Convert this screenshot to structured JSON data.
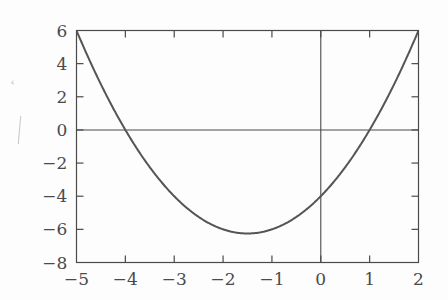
{
  "figure": {
    "background_color": "#fdfdfd",
    "axis_color": "#4a4a4a",
    "curve_color": "#555555",
    "tick_label_color": "#4a4a4a",
    "ylabel_fragment_color": "#c2c2c2",
    "ylabel_fragment_glyph": "ˆ"
  },
  "chart_data": {
    "type": "line",
    "title": "",
    "subtitle": "",
    "xlabel": "",
    "ylabel": "",
    "legend": [],
    "legend_position": "none",
    "grid": false,
    "frame": true,
    "tick_direction": "in",
    "xlim": [
      -5,
      2
    ],
    "ylim": [
      -8,
      6
    ],
    "xticks": [
      -5,
      -4,
      -3,
      -2,
      -1,
      0,
      1,
      2
    ],
    "xtick_labels": [
      "−5",
      "−4",
      "−3",
      "−2",
      "−1",
      "0",
      "1",
      "2"
    ],
    "yticks": [
      -8,
      -6,
      -4,
      -2,
      0,
      2,
      4,
      6
    ],
    "ytick_labels": [
      "−8",
      "−6",
      "−4",
      "−2",
      "0",
      "2",
      "4",
      "6"
    ],
    "reference_lines": [
      {
        "name": "x-axis",
        "orientation": "horizontal",
        "value": 0
      },
      {
        "name": "y-axis",
        "orientation": "vertical",
        "value": 0
      }
    ],
    "series": [
      {
        "name": "parabola",
        "expression": "y = x^2 + 3x - 4",
        "roots": [
          -4,
          1
        ],
        "vertex": [
          -1.5,
          -6.25
        ],
        "y_intercept": -4,
        "x": [
          -5,
          -4.75,
          -4.5,
          -4.25,
          -4,
          -3.75,
          -3.5,
          -3.25,
          -3,
          -2.75,
          -2.5,
          -2.25,
          -2,
          -1.75,
          -1.5,
          -1.25,
          -1,
          -0.75,
          -0.5,
          -0.25,
          0,
          0.25,
          0.5,
          0.75,
          1,
          1.25,
          1.5,
          1.75,
          2
        ],
        "values": [
          6,
          4.8125,
          3.75,
          2.8125,
          2,
          1.3125,
          0.75,
          0.3125,
          0,
          -0.1875,
          -0.25,
          -0.1875,
          0,
          -0.1875,
          -0.25,
          -0.1875,
          0,
          0.3125,
          0.75,
          1.3125,
          2,
          2.8125,
          3.75,
          4.8125,
          6,
          7.3125,
          8.75,
          10.3125,
          12
        ]
      }
    ],
    "plotted_values": {
      "note": "y = (x+4)(x-1) evaluated on xlim",
      "x": [
        -5,
        -4.5,
        -4,
        -3.5,
        -3,
        -2.5,
        -2,
        -1.5,
        -1,
        -0.5,
        0,
        0.5,
        1,
        1.5,
        2
      ],
      "y": [
        6,
        2.75,
        0,
        -2.25,
        -4,
        -5.25,
        -6,
        -6.25,
        -6,
        -5.25,
        -4,
        -2.25,
        0,
        2.75,
        6
      ]
    }
  }
}
